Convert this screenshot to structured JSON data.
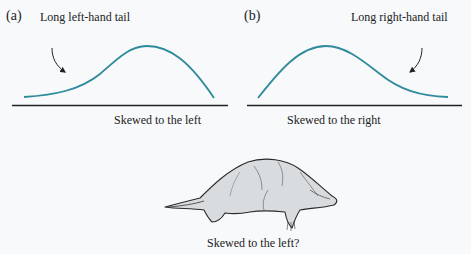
{
  "panels": [
    {
      "id": "a",
      "letter": "(a)",
      "tail_label": "Long left-hand tail",
      "caption": "Skewed to the left",
      "skew": "left"
    },
    {
      "id": "b",
      "letter": "(b)",
      "tail_label": "Long right-hand tail",
      "caption": "Skewed to the right",
      "skew": "right"
    }
  ],
  "illustration": {
    "subject": "mole-like animal silhouette",
    "caption": "Skewed to the left?"
  },
  "colors": {
    "curve": "#2f8a9c",
    "axis": "#222222",
    "arrow": "#222222",
    "animal_fill": "#d9dcdf",
    "animal_stroke": "#2a2a2a",
    "background": "#f7f9fb"
  }
}
